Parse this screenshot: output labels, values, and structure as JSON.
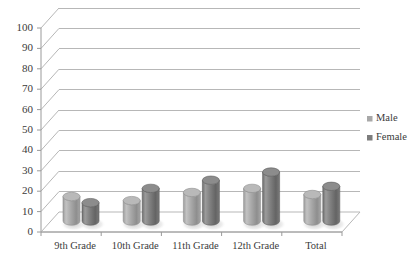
{
  "chart_data": {
    "type": "bar",
    "title": "",
    "subtitle": "",
    "xlabel": "",
    "ylabel": "",
    "categories": [
      "9th Grade",
      "10th Grade",
      "11th Grade",
      "12th Grade",
      "Total"
    ],
    "series": [
      {
        "name": "Male",
        "values": [
          12,
          10,
          14,
          16,
          13
        ],
        "color": "#a8a8a8"
      },
      {
        "name": "Female",
        "values": [
          9,
          16,
          20,
          24,
          17
        ],
        "color": "#7d7d7d"
      }
    ],
    "ylim": [
      0,
      100
    ],
    "ytick_step": 10,
    "ytick_labels": [
      "0",
      "10",
      "20",
      "30",
      "40",
      "50",
      "60",
      "70",
      "80",
      "90",
      "100"
    ],
    "grid": true,
    "grid_color": "#b7b7b7",
    "legend_position": "right",
    "style": "3d-cylinder",
    "plot_background": "#ffffff",
    "axis_color": "#9a9a9a",
    "text_color": "#3b3b3b"
  },
  "legend": {
    "items": [
      {
        "label": "Male",
        "marker": "square-marker",
        "color": "#a8a8a8"
      },
      {
        "label": "Female",
        "marker": "square-marker",
        "color": "#7d7d7d"
      }
    ]
  }
}
